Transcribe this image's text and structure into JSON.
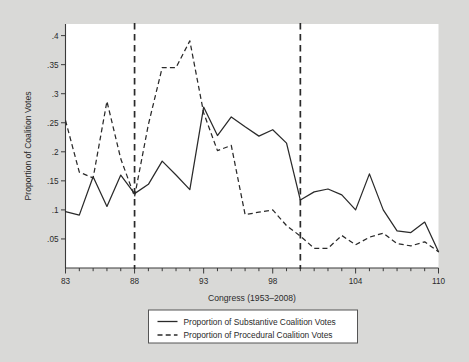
{
  "chart_data": {
    "type": "line",
    "title": "",
    "xlabel": "Congress (1953–2008)",
    "ylabel": "Proportion of Coalition Votes",
    "xlim": [
      83,
      110
    ],
    "ylim": [
      0.0,
      0.42
    ],
    "grid": false,
    "legend_position": "below-axes",
    "x": [
      83,
      84,
      85,
      86,
      87,
      88,
      89,
      90,
      91,
      92,
      93,
      94,
      95,
      96,
      97,
      98,
      99,
      100,
      101,
      102,
      103,
      104,
      105,
      106,
      107,
      108,
      109,
      110
    ],
    "xticks_major": [
      83,
      88,
      93,
      98,
      104,
      110
    ],
    "xticks_major_labels": [
      "83",
      "88",
      "93",
      "98",
      "104",
      "110"
    ],
    "xticks_minor": [
      84,
      85,
      86,
      87,
      89,
      90,
      91,
      92,
      94,
      95,
      96,
      97,
      99,
      100,
      101,
      102,
      103,
      105,
      106,
      107,
      108,
      109
    ],
    "yticks": [
      0.05,
      0.1,
      0.15,
      0.2,
      0.25,
      0.3,
      0.35,
      0.4
    ],
    "ytick_labels": [
      ".05",
      ".1",
      ".15",
      ".2",
      ".25",
      ".3",
      ".35",
      ".4"
    ],
    "reference_lines": [
      {
        "x": 88,
        "style": "dashed",
        "orientation": "vertical"
      },
      {
        "x": 100,
        "style": "dashed",
        "orientation": "vertical"
      }
    ],
    "series": [
      {
        "name": "Proportion of Substantive Coalition Votes",
        "style": "solid",
        "values": [
          0.097,
          0.091,
          0.157,
          0.106,
          0.16,
          0.128,
          0.144,
          0.184,
          0.16,
          0.135,
          0.277,
          0.228,
          0.26,
          0.243,
          0.227,
          0.238,
          0.215,
          0.117,
          0.131,
          0.136,
          0.126,
          0.1,
          0.162,
          0.1,
          0.064,
          0.061,
          0.079,
          0.028
        ]
      },
      {
        "name": "Proportion of Procedural Coalition Votes",
        "style": "dashed",
        "values": [
          0.254,
          0.165,
          0.155,
          0.287,
          0.188,
          0.123,
          0.247,
          0.345,
          0.345,
          0.391,
          0.267,
          0.202,
          0.211,
          0.092,
          0.096,
          0.1,
          0.073,
          0.055,
          0.034,
          0.034,
          0.056,
          0.04,
          0.053,
          0.06,
          0.042,
          0.038,
          0.045,
          0.028
        ]
      }
    ]
  },
  "legend": {
    "entries": [
      {
        "label": "Proportion of Substantive Coalition Votes",
        "style": "solid"
      },
      {
        "label": "Proportion of Procedural Coalition Votes",
        "style": "dashed"
      }
    ]
  }
}
